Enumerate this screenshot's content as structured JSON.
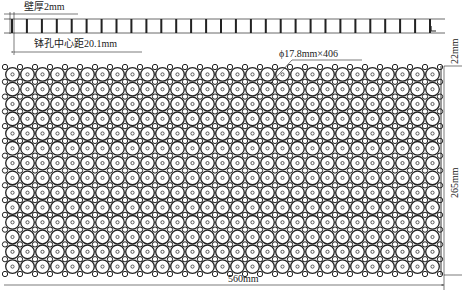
{
  "top_section": {
    "wall_thickness_label": "壁厚2mm",
    "hole_pitch_label": "钵孔中心距20.1mm",
    "cell_count": 29
  },
  "tray": {
    "hole_spec_label": "ϕ17.8mm×406",
    "columns": 29,
    "rows": 14,
    "total_holes": 406
  },
  "dimensions": {
    "depth_label": "22mm",
    "height_label": "265mm",
    "width_label": "560mm"
  },
  "colors": {
    "line": "#222222",
    "background": "#ffffff",
    "hole_fill": "#ffffff"
  }
}
